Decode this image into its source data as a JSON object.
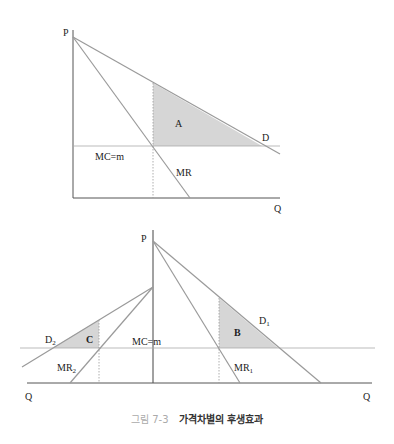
{
  "top_chart": {
    "axis_y_label": "P",
    "axis_x_label": "Q",
    "demand_label": "D",
    "mr_label": "MR",
    "mc_label": "MC=m",
    "area_label": "A",
    "colors": {
      "line": "#9a9a9a",
      "axis": "#444444",
      "fill": "#d6d6d6"
    }
  },
  "bottom_chart": {
    "axis_y_label": "P",
    "axis_x_left_label": "Q",
    "axis_x_right_label": "Q",
    "d1_label": "D",
    "d1_sub": "1",
    "mr1_label": "MR",
    "mr1_sub": "1",
    "d2_label": "D",
    "d2_sub": "2",
    "mr2_label": "MR",
    "mr2_sub": "2",
    "mc_label": "MC=m",
    "area_b_label": "B",
    "area_c_label": "C"
  },
  "caption": {
    "number": "그림 7-3",
    "title": "가격차별의 후생효과"
  }
}
